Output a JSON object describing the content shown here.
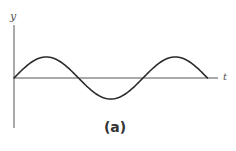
{
  "figure": {
    "y_axis_label": "y",
    "x_axis_label": "t",
    "caption": "(a)",
    "colors": {
      "curve": "#2b2b2b",
      "axis": "#555555",
      "background": "#ffffff"
    }
  },
  "chart_data": {
    "type": "line",
    "title": "",
    "caption": "(a)",
    "xlabel": "t",
    "ylabel": "y",
    "periods_shown": 1.5,
    "x": [
      0,
      0.25,
      0.5,
      0.75,
      1.0,
      1.25,
      1.5
    ],
    "y": [
      0,
      1,
      0,
      -1,
      0,
      1,
      0
    ],
    "x_units": "periods",
    "y_units": "amplitude",
    "grid": false,
    "legend": false
  }
}
